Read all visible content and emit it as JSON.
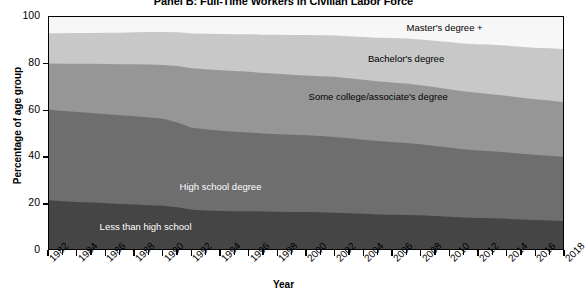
{
  "chart_data": {
    "type": "area",
    "stacked": true,
    "title": "Panel B: Full-Time Workers in Civilian Labor Force",
    "xlabel": "Year",
    "ylabel": "Percentage of age group",
    "ylim": [
      0,
      100
    ],
    "yticks": [
      0,
      20,
      40,
      60,
      80,
      100
    ],
    "xlim": [
      1982,
      2018
    ],
    "grid": false,
    "legend_position": "inline-labels",
    "x": [
      1982,
      1983,
      1984,
      1985,
      1986,
      1987,
      1988,
      1989,
      1990,
      1991,
      1992,
      1993,
      1994,
      1995,
      1996,
      1997,
      1998,
      1999,
      2000,
      2001,
      2002,
      2003,
      2004,
      2005,
      2006,
      2007,
      2008,
      2009,
      2010,
      2011,
      2012,
      2013,
      2014,
      2015,
      2016,
      2017,
      2018
    ],
    "xtick_labels": [
      "1982",
      "1984",
      "1986",
      "1988",
      "1990",
      "1992",
      "1994",
      "1996",
      "1998",
      "2000",
      "2002",
      "2004",
      "2006",
      "2008",
      "2010",
      "2012",
      "2014",
      "2016",
      "2018"
    ],
    "series": [
      {
        "name": "Less than high school",
        "color": "#454545",
        "label_color": "#ffffff",
        "values": [
          21.0,
          20.6,
          20.3,
          20.0,
          19.7,
          19.4,
          19.2,
          18.9,
          18.6,
          18.0,
          16.9,
          16.6,
          16.4,
          16.3,
          16.3,
          16.2,
          16.1,
          16.0,
          15.9,
          15.8,
          15.6,
          15.4,
          15.2,
          14.9,
          14.8,
          14.7,
          14.5,
          14.2,
          13.9,
          13.6,
          13.4,
          13.2,
          13.0,
          12.7,
          12.5,
          12.3,
          12.1
        ]
      },
      {
        "name": "High school degree",
        "color": "#6e6e6e",
        "label_color": "#ffffff",
        "values": [
          39.0,
          38.9,
          38.8,
          38.6,
          38.4,
          38.2,
          38.0,
          37.8,
          37.5,
          36.5,
          35.4,
          35.0,
          34.6,
          34.2,
          33.9,
          33.6,
          33.4,
          33.2,
          33.1,
          32.9,
          32.7,
          32.3,
          31.9,
          31.6,
          31.3,
          31.0,
          30.6,
          30.2,
          29.8,
          29.4,
          29.1,
          28.9,
          28.7,
          28.4,
          28.1,
          27.9,
          27.7
        ]
      },
      {
        "name": "Some college/associate's degree",
        "color": "#969696",
        "label_color": "#000000",
        "values": [
          20.0,
          20.4,
          20.8,
          21.2,
          21.6,
          22.0,
          22.4,
          22.8,
          23.2,
          24.4,
          25.6,
          25.9,
          26.1,
          26.2,
          26.2,
          26.1,
          26.0,
          25.9,
          25.8,
          25.8,
          25.9,
          25.9,
          25.9,
          25.8,
          25.7,
          25.6,
          25.5,
          25.4,
          25.2,
          25.0,
          24.8,
          24.6,
          24.4,
          24.2,
          24.0,
          23.8,
          23.6
        ]
      },
      {
        "name": "Bachelor's degree",
        "color": "#c8c8c8",
        "label_color": "#000000",
        "values": [
          13.0,
          13.1,
          13.2,
          13.3,
          13.5,
          13.6,
          13.8,
          14.0,
          14.2,
          14.5,
          15.0,
          15.3,
          15.6,
          15.9,
          16.2,
          16.5,
          16.8,
          17.1,
          17.4,
          17.6,
          17.8,
          18.1,
          18.4,
          18.8,
          19.1,
          19.4,
          19.7,
          20.0,
          20.3,
          20.6,
          21.0,
          21.3,
          21.6,
          21.9,
          22.2,
          22.5,
          22.8
        ]
      },
      {
        "name": "Master's degree +",
        "color": "#f7f7f7",
        "label_color": "#000000",
        "values": [
          7.0,
          7.0,
          6.9,
          6.9,
          6.8,
          6.8,
          6.6,
          6.5,
          6.5,
          6.6,
          7.1,
          7.2,
          7.3,
          7.4,
          7.4,
          7.6,
          7.7,
          7.8,
          7.8,
          7.9,
          8.0,
          8.3,
          8.6,
          8.9,
          9.1,
          9.3,
          9.7,
          10.2,
          10.8,
          11.4,
          11.7,
          12.0,
          12.3,
          12.8,
          13.2,
          13.5,
          13.8
        ]
      }
    ],
    "inline_labels": [
      {
        "text": "Master's degree +",
        "x_pct": 69.5,
        "y_pct": 95.0
      },
      {
        "text": "Bachelor's degree",
        "x_pct": 62.0,
        "y_pct": 81.5
      },
      {
        "text": "Some college/associate's degree",
        "x_pct": 50.5,
        "y_pct": 65.5
      },
      {
        "text": "High school degree",
        "x_pct": 25.5,
        "y_pct": 27.0
      },
      {
        "text": "Less than high school",
        "x_pct": 10.0,
        "y_pct": 10.0
      }
    ]
  }
}
